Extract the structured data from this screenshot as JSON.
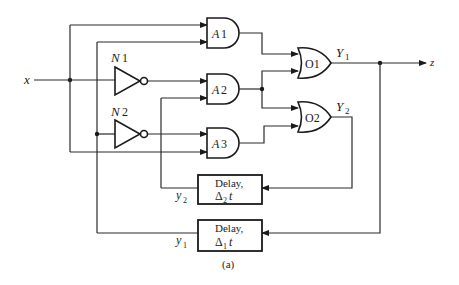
{
  "figure": {
    "caption": "(a)",
    "input_label": "x",
    "output_label": "z"
  },
  "gates": {
    "and": [
      {
        "id": "A1",
        "label_letter": "A",
        "label_num": "1"
      },
      {
        "id": "A2",
        "label_letter": "A",
        "label_num": "2"
      },
      {
        "id": "A3",
        "label_letter": "A",
        "label_num": "3"
      }
    ],
    "or": [
      {
        "id": "O1",
        "label": "O1"
      },
      {
        "id": "O2",
        "label": "O2"
      }
    ],
    "not": [
      {
        "id": "N1",
        "label_letter": "N",
        "label_num": "1"
      },
      {
        "id": "N2",
        "label_letter": "N",
        "label_num": "2"
      }
    ]
  },
  "signals": {
    "Y1": {
      "letter": "Y",
      "sub": "1"
    },
    "Y2": {
      "letter": "Y",
      "sub": "2"
    },
    "y1": {
      "letter": "y",
      "sub": "1"
    },
    "y2": {
      "letter": "y",
      "sub": "2"
    }
  },
  "delays": [
    {
      "id": "delay-2",
      "line1": "Delay,",
      "delta": "Δ",
      "sub": "2",
      "var": "t"
    },
    {
      "id": "delay-1",
      "line1": "Delay,",
      "delta": "Δ",
      "sub": "1",
      "var": "t"
    }
  ],
  "colors": {
    "line": "#2a2a2a",
    "background": "#ffffff"
  }
}
